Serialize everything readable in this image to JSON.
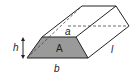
{
  "diagram": {
    "labels": {
      "area": "A",
      "top_width": "a",
      "bottom_width": "b",
      "height": "h",
      "length": "l"
    },
    "colors": {
      "face_fill": "#9a9a9a",
      "stroke": "#222222",
      "background": "#ffffff"
    }
  }
}
